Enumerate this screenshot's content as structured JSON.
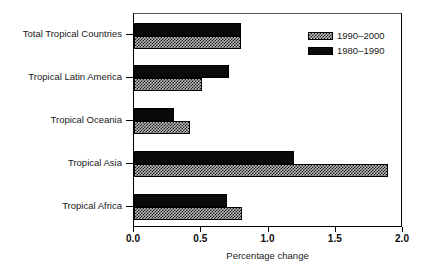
{
  "chart_data": {
    "type": "bar",
    "orientation": "horizontal",
    "title": "",
    "subtitle": "",
    "xlabel": "Percentage change",
    "ylabel": "",
    "xlim": [
      0.0,
      2.0
    ],
    "xticks": [
      "0.0",
      "0.5",
      "1.0",
      "1.5",
      "2.0"
    ],
    "xtick_values": [
      0.0,
      0.5,
      1.0,
      1.5,
      2.0
    ],
    "grid": false,
    "legend_position": "top-right",
    "categories": [
      "Total Tropical Countries",
      "Tropical Latin America",
      "Tropical Oceania",
      "Tropical Asia",
      "Tropical Africa"
    ],
    "series": [
      {
        "name": "1990–2000",
        "fill": "hatch",
        "color": "#b8b8b8",
        "values": [
          0.8,
          0.51,
          0.42,
          1.9,
          0.81
        ]
      },
      {
        "name": "1980–1990",
        "fill": "solid",
        "color": "#0a0a0a",
        "values": [
          0.8,
          0.71,
          0.3,
          1.2,
          0.7
        ]
      }
    ],
    "legend": [
      {
        "label": "1990–2000",
        "fill": "hatch"
      },
      {
        "label": "1980–1990",
        "fill": "solid"
      }
    ]
  },
  "figure": {
    "background": "#ffffff",
    "axis_color": "#000000",
    "text_color": "#1a1a1a"
  }
}
